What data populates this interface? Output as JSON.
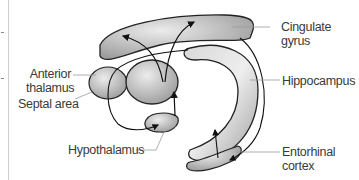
{
  "diagram": {
    "labels": {
      "cingulate_gyrus": [
        "Cingulate",
        "gyrus"
      ],
      "anterior_thalamus": [
        "Anterior",
        "thalamus"
      ],
      "septal_area": "Septal area",
      "hippocampus": "Hippocampus",
      "hypothalamus": "Hypothalamus",
      "entorhinal_cortex": [
        "Entorhinal",
        "cortex"
      ]
    },
    "colors": {
      "structure_fill_light": "#e4e4e4",
      "structure_fill_dark": "#a8a8a8",
      "outline": "#222222",
      "leader_line": "#9a9a9a",
      "text": "#3a3a3a"
    }
  }
}
